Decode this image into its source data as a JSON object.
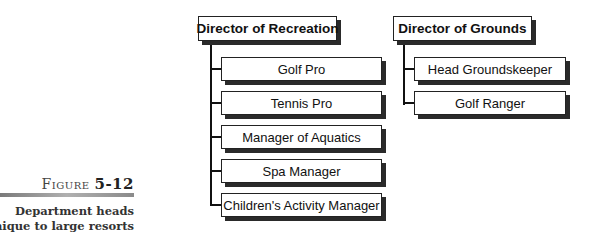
{
  "figure": {
    "label_prefix": "Figure",
    "number": "5-12",
    "caption_line1": "Department heads",
    "caption_line2": "unique to large resorts"
  },
  "org_chart": {
    "recreation": {
      "title": "Director of Recreation",
      "reports": [
        "Golf Pro",
        "Tennis Pro",
        "Manager of Aquatics",
        "Spa Manager",
        "Children's Activity Manager"
      ]
    },
    "grounds": {
      "title": "Director of Grounds",
      "reports": [
        "Head Groundskeeper",
        "Golf Ranger"
      ]
    }
  }
}
